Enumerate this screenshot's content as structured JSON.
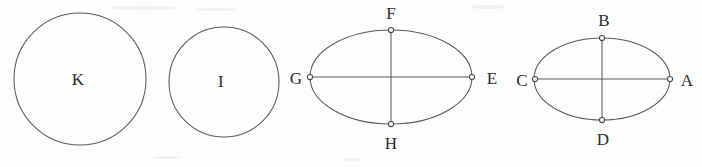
{
  "figure": {
    "width": 702,
    "height": 167,
    "background_color": "#fdfdfd",
    "stroke_color": "#5a5a5c",
    "label_color": "#2b2b2d",
    "marker_fill_color": "#ffffff"
  },
  "shapes": [
    {
      "id": "circle-k",
      "type": "circle",
      "label": "K",
      "cx": 80,
      "cy": 79,
      "rx": 66,
      "ry": 66,
      "label_x": 78,
      "label_y": 79,
      "has_axes": false,
      "vertices": []
    },
    {
      "id": "circle-i",
      "type": "circle",
      "label": "I",
      "cx": 224,
      "cy": 82,
      "rx": 55,
      "ry": 55,
      "label_x": 221,
      "label_y": 81,
      "has_axes": false,
      "vertices": []
    },
    {
      "id": "ellipse-efgh",
      "type": "ellipse",
      "label": "",
      "cx": 391,
      "cy": 77,
      "rx": 81,
      "ry": 47,
      "has_axes": true,
      "vertices": [
        {
          "name": "F",
          "position": "top",
          "x": 391,
          "y": 30,
          "label_x": 391,
          "label_y": 13
        },
        {
          "name": "E",
          "position": "right",
          "x": 472,
          "y": 77,
          "label_x": 492,
          "label_y": 78
        },
        {
          "name": "H",
          "position": "bottom",
          "x": 391,
          "y": 124,
          "label_x": 391,
          "label_y": 143
        },
        {
          "name": "G",
          "position": "left",
          "x": 310,
          "y": 77,
          "label_x": 296,
          "label_y": 78
        }
      ]
    },
    {
      "id": "ellipse-abcd",
      "type": "ellipse",
      "label": "",
      "cx": 602,
      "cy": 79,
      "rx": 68,
      "ry": 41,
      "has_axes": true,
      "vertices": [
        {
          "name": "B",
          "position": "top",
          "x": 602,
          "y": 38,
          "label_x": 604,
          "label_y": 20
        },
        {
          "name": "A",
          "position": "right",
          "x": 670,
          "y": 79,
          "label_x": 687,
          "label_y": 80
        },
        {
          "name": "D",
          "position": "bottom",
          "x": 602,
          "y": 120,
          "label_x": 603,
          "label_y": 139
        },
        {
          "name": "C",
          "position": "left",
          "x": 535,
          "y": 79,
          "label_x": 522,
          "label_y": 80
        }
      ]
    }
  ],
  "vertex_marker_radius": 2.6
}
